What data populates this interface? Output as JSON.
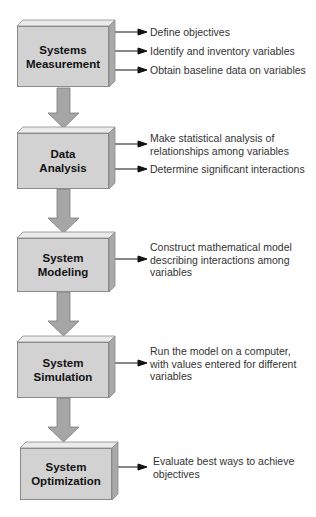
{
  "diagram": {
    "type": "flowchart",
    "direction": "top-to-bottom",
    "colors": {
      "box_face": "#d2d2d2",
      "box_top": "#ebebeb",
      "box_side": "#a9a9a9",
      "connector": "#a6a6a6",
      "text": "#333333"
    },
    "steps": [
      {
        "title": "Systems\nMeasurement",
        "title_lines": [
          "Systems",
          "Measurement"
        ],
        "outputs": [
          "Define objectives",
          "Identify and inventory variables",
          "Obtain baseline data on variables"
        ]
      },
      {
        "title_lines": [
          "Data",
          "Analysis"
        ],
        "outputs": [
          "Make statistical analysis of\nrelationships among variables",
          "Determine significant interactions"
        ],
        "output_lines": [
          [
            "Make statistical analysis of",
            "relationships among variables"
          ],
          [
            "Determine significant interactions"
          ]
        ]
      },
      {
        "title_lines": [
          "System",
          "Modeling"
        ],
        "output_lines": [
          [
            "Construct mathematical model",
            "describing interactions among",
            "variables"
          ]
        ]
      },
      {
        "title_lines": [
          "System",
          "Simulation"
        ],
        "output_lines": [
          [
            "Run the model on a computer,",
            "with values entered for different",
            "variables"
          ]
        ]
      },
      {
        "title_lines": [
          "System",
          "Optimization"
        ],
        "output_lines": [
          [
            "Evaluate best ways to achieve",
            "objectives"
          ]
        ]
      }
    ]
  }
}
